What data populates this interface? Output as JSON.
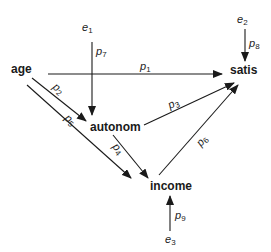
{
  "diagram": {
    "type": "path-diagram",
    "nodes": {
      "age": "age",
      "autonom": "autonom",
      "income": "income",
      "satis": "satis"
    },
    "errors": {
      "e1": {
        "base": "e",
        "sub": "1"
      },
      "e2": {
        "base": "e",
        "sub": "2"
      },
      "e3": {
        "base": "e",
        "sub": "3"
      }
    },
    "paths": {
      "p1": {
        "base": "p",
        "sub": "1",
        "from": "age",
        "to": "satis"
      },
      "p2": {
        "base": "p",
        "sub": "2",
        "from": "age",
        "to": "autonom"
      },
      "p3": {
        "base": "p",
        "sub": "3",
        "from": "autonom",
        "to": "satis"
      },
      "p4": {
        "base": "p",
        "sub": "4",
        "from": "autonom",
        "to": "income"
      },
      "p5": {
        "base": "p",
        "sub": "5",
        "from": "age",
        "to": "income"
      },
      "p6": {
        "base": "p",
        "sub": "6",
        "from": "income",
        "to": "satis"
      },
      "p7": {
        "base": "p",
        "sub": "7",
        "from": "e1",
        "to": "autonom"
      },
      "p8": {
        "base": "p",
        "sub": "8",
        "from": "e2",
        "to": "satis"
      },
      "p9": {
        "base": "p",
        "sub": "9",
        "from": "e3",
        "to": "income"
      }
    },
    "colors": {
      "ink": "#1a1a1a",
      "background": "#ffffff"
    }
  }
}
